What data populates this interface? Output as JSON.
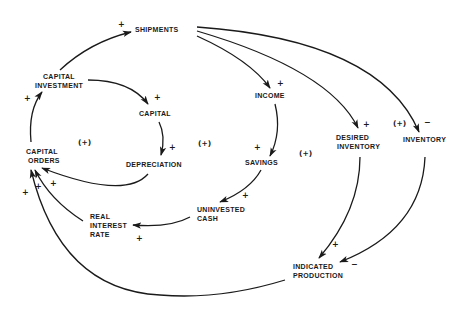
{
  "diagram": {
    "type": "causal-loop-diagram",
    "nodes": {
      "shipments": "SHIPMENTS",
      "capital_investment_1": "CAPITAL",
      "capital_investment_2": "INVESTMENT",
      "capital": "CAPITAL",
      "capital_orders_1": "CAPITAL",
      "capital_orders_2": "ORDERS",
      "depreciation": "DEPRECIATION",
      "income": "INCOME",
      "savings": "SAVINGS",
      "uninvested_cash_1": "UNINVESTED",
      "uninvested_cash_2": "CASH",
      "real_interest_rate_1": "REAL",
      "real_interest_rate_2": "INTEREST",
      "real_interest_rate_3": "RATE",
      "desired_inventory_1": "DESIRED",
      "desired_inventory_2": "INVENTORY",
      "inventory": "INVENTORY",
      "indicated_production_1": "INDICATED",
      "indicated_production_2": "PRODUCTION"
    },
    "edges": [
      {
        "from": "CAPITAL INVESTMENT",
        "to": "SHIPMENTS",
        "polarity": "+"
      },
      {
        "from": "CAPITAL INVESTMENT",
        "to": "CAPITAL",
        "polarity": "+"
      },
      {
        "from": "CAPITAL",
        "to": "DEPRECIATION",
        "polarity": "+"
      },
      {
        "from": "DEPRECIATION",
        "to": "CAPITAL ORDERS",
        "polarity": "+"
      },
      {
        "from": "CAPITAL ORDERS",
        "to": "CAPITAL INVESTMENT",
        "polarity": "+"
      },
      {
        "from": "SHIPMENTS",
        "to": "INCOME",
        "polarity": "+"
      },
      {
        "from": "SHIPMENTS",
        "to": "DESIRED INVENTORY",
        "polarity": "+"
      },
      {
        "from": "SHIPMENTS",
        "to": "INVENTORY",
        "polarity": "-"
      },
      {
        "from": "INCOME",
        "to": "SAVINGS",
        "polarity": "+"
      },
      {
        "from": "SAVINGS",
        "to": "UNINVESTED CASH",
        "polarity": "+"
      },
      {
        "from": "UNINVESTED CASH",
        "to": "REAL INTEREST RATE",
        "polarity": "+"
      },
      {
        "from": "REAL INTEREST RATE",
        "to": "CAPITAL ORDERS",
        "polarity": "+"
      },
      {
        "from": "DESIRED INVENTORY",
        "to": "INDICATED PRODUCTION",
        "polarity": "+"
      },
      {
        "from": "INVENTORY",
        "to": "INDICATED PRODUCTION",
        "polarity": "-"
      },
      {
        "from": "INDICATED PRODUCTION",
        "to": "CAPITAL ORDERS",
        "polarity": "+"
      }
    ],
    "polarity_marks": {
      "plus": "+",
      "minus": "−"
    },
    "loop_markers": {
      "loop1": "(+)",
      "loop2": "(+)",
      "loop3": "(+)",
      "loop4": "(+)"
    }
  }
}
